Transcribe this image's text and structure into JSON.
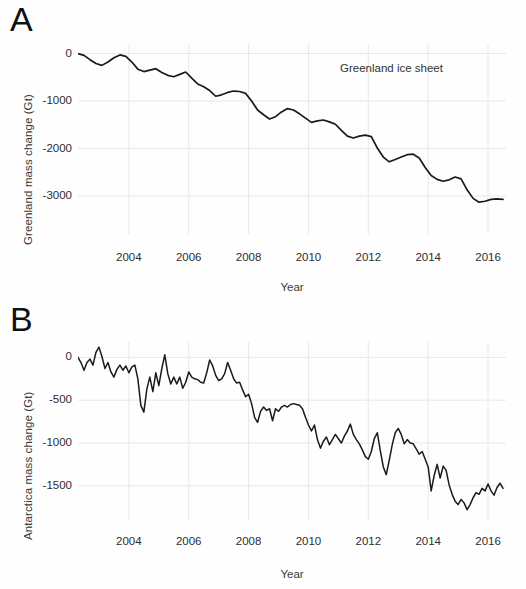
{
  "figure": {
    "background_color": "#fefefe",
    "line_color": "#1a1a1a",
    "grid_color": "#e8e8e8"
  },
  "panels": [
    {
      "letter": "A",
      "ylabel": "Greenland mass change (Gt)",
      "xlabel": "Year",
      "annotation": "Greenland ice sheet",
      "yticks": [
        "0",
        "-1000",
        "-2000",
        "-3000"
      ],
      "xticks": [
        "2004",
        "2006",
        "2008",
        "2010",
        "2012",
        "2014",
        "2016"
      ]
    },
    {
      "letter": "B",
      "ylabel": "Antarctica mass change (Gt)",
      "xlabel": "Year",
      "annotation": "Antarctic ice sheet",
      "yticks": [
        "0",
        "-500",
        "-1000",
        "-1500"
      ],
      "xticks": [
        "2004",
        "2006",
        "2008",
        "2010",
        "2012",
        "2014",
        "2016"
      ]
    }
  ],
  "chart_data": [
    {
      "type": "line",
      "title": "Greenland ice sheet",
      "xlabel": "Year",
      "ylabel": "Greenland mass change (Gt)",
      "xlim": [
        2002.3,
        2016.6
      ],
      "ylim": [
        -3800,
        200
      ],
      "xticks": [
        2004,
        2006,
        2008,
        2010,
        2012,
        2014,
        2016
      ],
      "yticks": [
        0,
        -1000,
        -2000,
        -3000
      ],
      "grid": true,
      "legend": false,
      "annotations": [
        {
          "text": "Greenland ice sheet",
          "x": 2013.0,
          "y": -250
        }
      ],
      "series": [
        {
          "name": "Greenland mass change",
          "x": [
            2002.3,
            2002.5,
            2002.7,
            2002.9,
            2003.1,
            2003.3,
            2003.5,
            2003.7,
            2003.9,
            2004.1,
            2004.3,
            2004.5,
            2004.7,
            2004.9,
            2005.1,
            2005.3,
            2005.5,
            2005.7,
            2005.9,
            2006.1,
            2006.3,
            2006.5,
            2006.7,
            2006.9,
            2007.1,
            2007.3,
            2007.5,
            2007.7,
            2007.9,
            2008.1,
            2008.3,
            2008.5,
            2008.7,
            2008.9,
            2009.1,
            2009.3,
            2009.5,
            2009.7,
            2009.9,
            2010.1,
            2010.3,
            2010.5,
            2010.7,
            2010.9,
            2011.1,
            2011.3,
            2011.5,
            2011.7,
            2011.9,
            2012.1,
            2012.3,
            2012.5,
            2012.7,
            2012.9,
            2013.1,
            2013.3,
            2013.5,
            2013.7,
            2013.9,
            2014.1,
            2014.3,
            2014.5,
            2014.7,
            2014.9,
            2015.1,
            2015.3,
            2015.5,
            2015.7,
            2015.9,
            2016.1,
            2016.3,
            2016.5
          ],
          "y": [
            0,
            -40,
            -130,
            -210,
            -250,
            -180,
            -90,
            -30,
            -60,
            -180,
            -330,
            -380,
            -350,
            -320,
            -400,
            -460,
            -490,
            -440,
            -390,
            -520,
            -640,
            -700,
            -780,
            -900,
            -870,
            -820,
            -790,
            -800,
            -840,
            -1000,
            -1190,
            -1290,
            -1380,
            -1330,
            -1230,
            -1160,
            -1190,
            -1270,
            -1360,
            -1450,
            -1420,
            -1400,
            -1440,
            -1490,
            -1620,
            -1740,
            -1780,
            -1740,
            -1720,
            -1750,
            -1990,
            -2180,
            -2280,
            -2230,
            -2180,
            -2130,
            -2120,
            -2200,
            -2400,
            -2570,
            -2650,
            -2690,
            -2660,
            -2600,
            -2640,
            -2870,
            -3050,
            -3130,
            -3110,
            -3070,
            -3060,
            -3070
          ]
        }
      ]
    },
    {
      "type": "line",
      "title": "Antarctic ice sheet",
      "xlabel": "Year",
      "ylabel": "Antarctica mass change (Gt)",
      "xlim": [
        2002.3,
        2016.6
      ],
      "ylim": [
        -1900,
        180
      ],
      "xticks": [
        2004,
        2006,
        2008,
        2010,
        2012,
        2014,
        2016
      ],
      "yticks": [
        0,
        -500,
        -1000,
        -1500
      ],
      "grid": true,
      "legend": false,
      "annotations": [
        {
          "text": "Antarctic ice sheet",
          "x": 2013.0,
          "y": -120
        }
      ],
      "series": [
        {
          "name": "Antarctica mass change",
          "x": [
            2002.3,
            2002.4,
            2002.5,
            2002.6,
            2002.7,
            2002.8,
            2002.9,
            2003.0,
            2003.1,
            2003.2,
            2003.3,
            2003.4,
            2003.5,
            2003.6,
            2003.7,
            2003.8,
            2003.9,
            2004.0,
            2004.1,
            2004.2,
            2004.3,
            2004.4,
            2004.5,
            2004.6,
            2004.7,
            2004.8,
            2004.9,
            2005.0,
            2005.1,
            2005.2,
            2005.3,
            2005.4,
            2005.5,
            2005.6,
            2005.7,
            2005.8,
            2005.9,
            2006.0,
            2006.1,
            2006.2,
            2006.3,
            2006.4,
            2006.5,
            2006.6,
            2006.7,
            2006.8,
            2006.9,
            2007.0,
            2007.1,
            2007.2,
            2007.3,
            2007.4,
            2007.5,
            2007.6,
            2007.7,
            2007.8,
            2007.9,
            2008.0,
            2008.1,
            2008.2,
            2008.3,
            2008.4,
            2008.5,
            2008.6,
            2008.7,
            2008.8,
            2008.9,
            2009.0,
            2009.1,
            2009.2,
            2009.3,
            2009.4,
            2009.5,
            2009.6,
            2009.7,
            2009.8,
            2009.9,
            2010.0,
            2010.1,
            2010.2,
            2010.3,
            2010.4,
            2010.5,
            2010.6,
            2010.7,
            2010.8,
            2010.9,
            2011.0,
            2011.1,
            2011.2,
            2011.3,
            2011.4,
            2011.5,
            2011.6,
            2011.7,
            2011.8,
            2011.9,
            2012.0,
            2012.1,
            2012.2,
            2012.3,
            2012.4,
            2012.5,
            2012.6,
            2012.7,
            2012.8,
            2012.9,
            2013.0,
            2013.1,
            2013.2,
            2013.3,
            2013.4,
            2013.5,
            2013.6,
            2013.7,
            2013.8,
            2013.9,
            2014.0,
            2014.1,
            2014.2,
            2014.3,
            2014.4,
            2014.5,
            2014.6,
            2014.7,
            2014.8,
            2014.9,
            2015.0,
            2015.1,
            2015.2,
            2015.3,
            2015.4,
            2015.5,
            2015.6,
            2015.7,
            2015.8,
            2015.9,
            2016.0,
            2016.1,
            2016.2,
            2016.3,
            2016.4,
            2016.5
          ],
          "y": [
            0,
            -60,
            -150,
            -60,
            -20,
            -90,
            60,
            120,
            10,
            -130,
            -60,
            -170,
            -230,
            -140,
            -90,
            -150,
            -100,
            -180,
            -110,
            -90,
            -250,
            -560,
            -640,
            -370,
            -230,
            -400,
            -180,
            -330,
            -130,
            30,
            -190,
            -310,
            -230,
            -310,
            -230,
            -360,
            -290,
            -170,
            -230,
            -250,
            -260,
            -290,
            -300,
            -180,
            -30,
            -100,
            -210,
            -270,
            -250,
            -190,
            -60,
            -150,
            -250,
            -300,
            -290,
            -380,
            -460,
            -430,
            -540,
            -700,
            -760,
            -630,
            -580,
            -620,
            -600,
            -740,
            -600,
            -630,
            -580,
            -560,
            -580,
            -550,
            -540,
            -550,
            -560,
            -600,
            -700,
            -790,
            -860,
            -790,
            -960,
            -1060,
            -980,
            -930,
            -1020,
            -960,
            -900,
            -950,
            -1000,
            -920,
            -860,
            -780,
            -900,
            -960,
            -1010,
            -1080,
            -1160,
            -1190,
            -1100,
            -950,
            -880,
            -1090,
            -1280,
            -1370,
            -1200,
            -1020,
            -880,
            -830,
            -900,
            -1010,
            -960,
            -1000,
            -1010,
            -1070,
            -1130,
            -1100,
            -1190,
            -1280,
            -1560,
            -1380,
            -1250,
            -1410,
            -1270,
            -1320,
            -1490,
            -1600,
            -1680,
            -1720,
            -1660,
            -1700,
            -1780,
            -1720,
            -1640,
            -1580,
            -1600,
            -1530,
            -1560,
            -1480,
            -1560,
            -1610,
            -1520,
            -1470,
            -1530
          ]
        }
      ]
    }
  ]
}
